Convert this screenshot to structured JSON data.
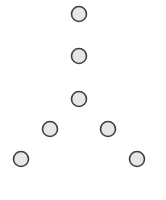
{
  "diagram": {
    "type": "node-layout",
    "shape": "inverted-Y",
    "background": "#ffffff",
    "node_style": {
      "radius": 7.5,
      "fill": "#e6e6e6",
      "stroke": "#3f3f3f",
      "stroke_width": 1.6
    },
    "nodes": [
      {
        "id": "n1",
        "x": 79,
        "y": 14
      },
      {
        "id": "n2",
        "x": 79,
        "y": 56
      },
      {
        "id": "n3",
        "x": 79,
        "y": 99
      },
      {
        "id": "n4",
        "x": 50,
        "y": 129
      },
      {
        "id": "n5",
        "x": 108,
        "y": 129
      },
      {
        "id": "n6",
        "x": 21,
        "y": 159
      },
      {
        "id": "n7",
        "x": 137,
        "y": 159
      }
    ],
    "edges": []
  }
}
